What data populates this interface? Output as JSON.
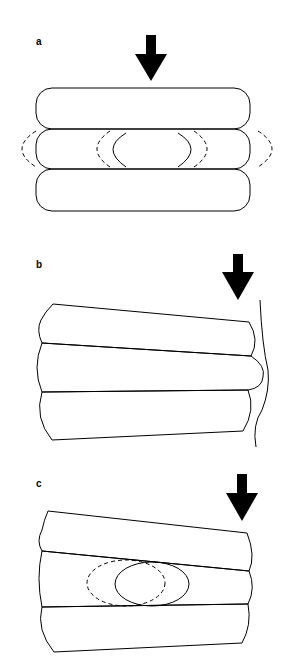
{
  "figure": {
    "panels": [
      {
        "id": "a",
        "label": "a",
        "description": "Three stacked rounded capsules under vertical load; middle layer shows solid inner lens and dashed bulging outlines"
      },
      {
        "id": "b",
        "label": "b",
        "description": "Three tapered stacked layers with load applied at right edge; wavy boundary line on right"
      },
      {
        "id": "c",
        "label": "c",
        "description": "Three tapered stacked layers with load at right; middle layer contains solid ellipse and dashed displaced ellipse"
      }
    ]
  }
}
